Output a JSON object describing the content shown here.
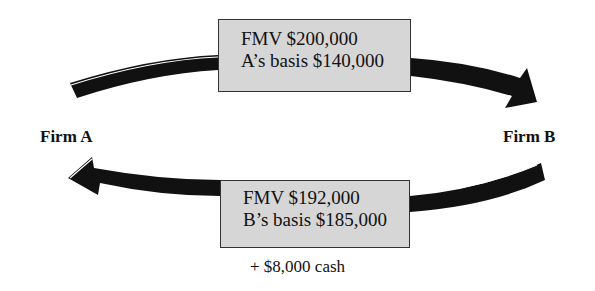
{
  "diagram": {
    "type": "exchange-flow",
    "parties": {
      "left": {
        "label": "Firm A"
      },
      "right": {
        "label": "Firm B"
      }
    },
    "transfers": [
      {
        "direction": "Firm A -> Firm B",
        "lines": [
          "FMV $200,000",
          "A’s basis $140,000"
        ]
      },
      {
        "direction": "Firm B -> Firm A",
        "lines": [
          "FMV $192,000",
          "B’s basis $185,000"
        ],
        "extra": "+ $8,000 cash"
      }
    ],
    "colors": {
      "arrow": "#111111",
      "box_fill": "#d6d6d6",
      "box_border": "#333333",
      "background": "#ffffff"
    }
  }
}
